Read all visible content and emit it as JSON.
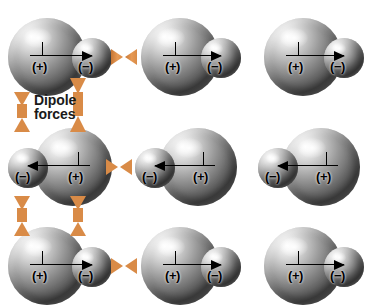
{
  "figure": {
    "background_color": "#ffffff",
    "width": 374,
    "height": 307,
    "force_arrow_color": "#d98b47",
    "vector_color": "#000000"
  },
  "annotation": {
    "dipole_forces_label": "Dipole\nforces"
  },
  "molecule_labels": {
    "positive": "(+)",
    "negative": "(−)"
  },
  "molecules": [
    {
      "id": "r1c1",
      "row": 1,
      "col": 1,
      "orientation": "right",
      "positive_label": "(+)",
      "negative_label": "(−)"
    },
    {
      "id": "r1c2",
      "row": 1,
      "col": 2,
      "orientation": "right",
      "positive_label": "(+)",
      "negative_label": "(−)"
    },
    {
      "id": "r1c3",
      "row": 1,
      "col": 3,
      "orientation": "right",
      "positive_label": "(+)",
      "negative_label": "(−)"
    },
    {
      "id": "r2c1",
      "row": 2,
      "col": 1,
      "orientation": "left",
      "positive_label": "(+)",
      "negative_label": "(−)"
    },
    {
      "id": "r2c2",
      "row": 2,
      "col": 2,
      "orientation": "left",
      "positive_label": "(+)",
      "negative_label": "(−)"
    },
    {
      "id": "r2c3",
      "row": 2,
      "col": 3,
      "orientation": "left",
      "positive_label": "(+)",
      "negative_label": "(−)"
    },
    {
      "id": "r3c1",
      "row": 3,
      "col": 1,
      "orientation": "right",
      "positive_label": "(+)",
      "negative_label": "(−)"
    },
    {
      "id": "r3c2",
      "row": 3,
      "col": 2,
      "orientation": "right",
      "positive_label": "(+)",
      "negative_label": "(−)"
    },
    {
      "id": "r3c3",
      "row": 3,
      "col": 3,
      "orientation": "right",
      "positive_label": "(+)",
      "negative_label": "(−)"
    }
  ],
  "force_arrows": {
    "horizontal": [
      {
        "id": "h-r1",
        "between": [
          "r1c1",
          "r1c2"
        ]
      },
      {
        "id": "h-r2",
        "between": [
          "r2c1",
          "r2c2"
        ]
      },
      {
        "id": "h-r3",
        "between": [
          "r3c1",
          "r3c2"
        ]
      }
    ],
    "vertical": [
      {
        "id": "v-c1-r1r2",
        "between": [
          "r1c1",
          "r2c1"
        ]
      },
      {
        "id": "v-c2-r1r2",
        "between": [
          "r1c1",
          "r2c1"
        ]
      },
      {
        "id": "v-c1-r2r3",
        "between": [
          "r2c1",
          "r3c1"
        ]
      },
      {
        "id": "v-c2-r2r3",
        "between": [
          "r2c1",
          "r3c1"
        ]
      }
    ]
  }
}
